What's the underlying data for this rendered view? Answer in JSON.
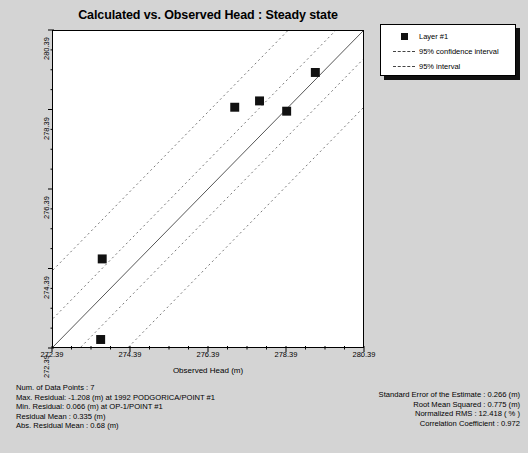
{
  "chart_data": {
    "type": "scatter",
    "title": "Calculated vs. Observed Head : Steady state",
    "xlabel": "Observed Head (m)",
    "ylabel": "Calculated Head (m)",
    "xlim": [
      272.39,
      280.39
    ],
    "ylim": [
      272.39,
      280.39
    ],
    "xticks": [
      "272.39",
      "274.39",
      "276.39",
      "278.39",
      "280.39"
    ],
    "yticks": [
      "272.39",
      "274.39",
      "276.39",
      "278.39",
      "280.39"
    ],
    "xtick_values": [
      272.39,
      274.39,
      276.39,
      278.39,
      280.39
    ],
    "ytick_values": [
      272.39,
      274.39,
      276.39,
      278.39,
      280.39
    ],
    "minor_ticks_per_interval": 4,
    "grid": false,
    "legend_position": "upper-right-outside",
    "series": [
      {
        "name": "Layer #1",
        "marker": "square",
        "color": "#111111",
        "points": [
          {
            "x": 273.62,
            "y": 272.58
          },
          {
            "x": 273.66,
            "y": 274.62
          },
          {
            "x": 277.08,
            "y": 278.46
          },
          {
            "x": 277.72,
            "y": 278.62
          },
          {
            "x": 278.42,
            "y": 278.36
          },
          {
            "x": 279.16,
            "y": 279.34
          },
          {
            "x": 280.2,
            "y": 280.56
          }
        ]
      }
    ],
    "reference_line": {
      "name": "1:1 fit line",
      "style": "solid",
      "color": "#555555"
    },
    "interval_bands": [
      {
        "name": "95% confidence interval",
        "style": "dashed",
        "offset": 0.72
      },
      {
        "name": "95% interval",
        "style": "dashed",
        "offset": 1.95
      }
    ],
    "legend": [
      {
        "label": "Layer #1",
        "key": "square"
      },
      {
        "label": "95% confidence interval",
        "key": "dash"
      },
      {
        "label": "95% interval",
        "key": "dash"
      }
    ],
    "annotations": {
      "left": [
        "Num. of Data Points : 7",
        "Max. Residual: -1.208 (m) at 1992 PODGORICA/POINT #1",
        "Min. Residual: 0.066 (m) at OP-1/POINT #1",
        "Residual Mean : 0.335 (m)",
        "Abs. Residual Mean : 0.68 (m)"
      ],
      "right": [
        "Standard Error of the Estimate : 0.266 (m)",
        "Root Mean Squared : 0.775 (m)",
        "Normalized RMS : 12.418 ( % )",
        "Correlation Coefficient : 0.972"
      ]
    }
  },
  "stats": {
    "num_data_points": "Num. of Data Points : 7",
    "max_residual": "Max. Residual: -1.208 (m) at 1992 PODGORICA/POINT #1",
    "min_residual": "Min. Residual: 0.066 (m) at OP-1/POINT #1",
    "residual_mean": "Residual Mean : 0.335 (m)",
    "abs_residual_mean": "Abs. Residual Mean : 0.68 (m)",
    "standard_error": "Standard Error of the Estimate : 0.266 (m)",
    "root_mean_squared": "Root Mean Squared : 0.775 (m)",
    "normalized_rms": "Normalized RMS : 12.418 ( % )",
    "correlation_coefficient": "Correlation Coefficient : 0.972"
  }
}
